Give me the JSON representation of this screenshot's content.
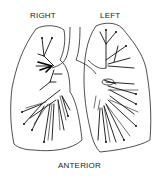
{
  "diagram": {
    "labels": {
      "right": "RIGHT",
      "left": "LEFT",
      "view": "ANTERIOR"
    },
    "parts": [
      "right-lung",
      "left-lung",
      "trachea",
      "bronchial-tree"
    ],
    "colors": {
      "line": "#111111",
      "background": "#ffffff"
    }
  }
}
